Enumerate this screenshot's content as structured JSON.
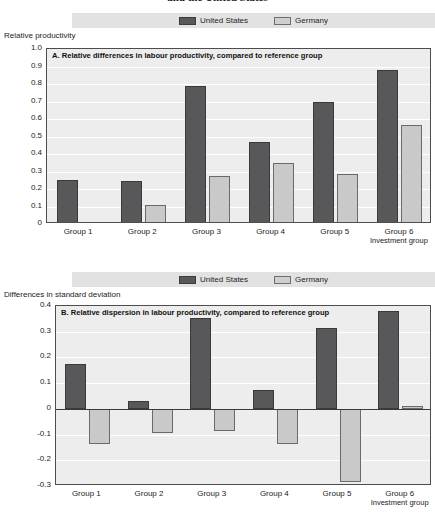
{
  "document": {
    "title_fragment": "and the United States"
  },
  "legend": {
    "items": [
      {
        "label": "United States",
        "color": "#58585a",
        "key": "us"
      },
      {
        "label": "Germany",
        "color": "#c9c9c9",
        "key": "de"
      }
    ]
  },
  "chart_data": [
    {
      "type": "bar",
      "panel": "A",
      "title": "A.   Relative differences in labour productivity, compared to reference group",
      "ylabel": "Relative productivity",
      "xlabel": "Investment group",
      "categories": [
        "Group 1",
        "Group 2",
        "Group 3",
        "Group 4",
        "Group 5",
        "Group 6"
      ],
      "series": [
        {
          "name": "United States",
          "color": "#58585a",
          "values": [
            0.25,
            0.245,
            0.79,
            0.47,
            0.7,
            0.88
          ]
        },
        {
          "name": "Germany",
          "color": "#c9c9c9",
          "values": [
            0.01,
            0.11,
            0.275,
            0.35,
            0.285,
            0.565
          ]
        }
      ],
      "ylim": [
        0,
        1.0
      ],
      "yticks": [
        "1.0",
        "0.9",
        "0.8",
        "0.7",
        "0.6",
        "0.5",
        "0.4",
        "0.3",
        "0.2",
        "0.1",
        "0"
      ],
      "ytick_values": [
        1.0,
        0.9,
        0.8,
        0.7,
        0.6,
        0.5,
        0.4,
        0.3,
        0.2,
        0.1,
        0
      ],
      "grid": true,
      "legend_position": "top"
    },
    {
      "type": "bar",
      "panel": "B",
      "title": "B.   Relative dispersion in labour productivity, compared to reference group",
      "ylabel": "Differences in standard deviation",
      "xlabel": "Investment group",
      "categories": [
        "Group 1",
        "Group 2",
        "Group 3",
        "Group 4",
        "Group 5",
        "Group 6"
      ],
      "series": [
        {
          "name": "United States",
          "color": "#58585a",
          "values": [
            0.175,
            0.03,
            0.355,
            0.075,
            0.315,
            0.38
          ]
        },
        {
          "name": "Germany",
          "color": "#c9c9c9",
          "values": [
            -0.135,
            -0.095,
            -0.085,
            -0.135,
            -0.285,
            0.01
          ]
        }
      ],
      "ylim": [
        -0.3,
        0.4
      ],
      "yticks": [
        "0.4",
        "0.3",
        "0.2",
        "0.1",
        "0",
        "-0.1",
        "-0.2",
        "-0.3"
      ],
      "ytick_values": [
        0.4,
        0.3,
        0.2,
        0.1,
        0,
        -0.1,
        -0.2,
        -0.3
      ],
      "grid": true,
      "legend_position": "top"
    }
  ]
}
